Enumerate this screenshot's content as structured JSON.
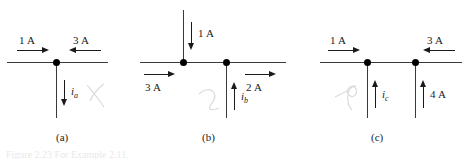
{
  "figure": {
    "caption": "Figure 2.23 For Example 2.11.",
    "background_color": "#ffffff",
    "wire_color": "#3a3a3a",
    "arrow_color": "#1a1a1a",
    "node_color": "#000000",
    "pencil_color": "#d9d9d9"
  },
  "panels": [
    {
      "id": "a",
      "caption": "(a)",
      "nodes": 1,
      "currents": [
        {
          "name": "left-branch-current",
          "label": "1 A",
          "direction": "right",
          "known": true
        },
        {
          "name": "right-branch-current",
          "label": "3 A",
          "direction": "left",
          "known": true
        },
        {
          "name": "unknown-branch-current",
          "label": "i",
          "subscript": "a",
          "direction": "down",
          "known": false
        }
      ]
    },
    {
      "id": "b",
      "caption": "(b)",
      "nodes": 2,
      "currents": [
        {
          "name": "top-branch-current",
          "label": "1 A",
          "direction": "down",
          "known": true
        },
        {
          "name": "left-branch-current",
          "label": "3 A",
          "direction": "right",
          "known": true
        },
        {
          "name": "right-branch-current",
          "label": "2 A",
          "direction": "right",
          "known": true
        },
        {
          "name": "unknown-branch-current",
          "label": "i",
          "subscript": "b",
          "direction": "up",
          "known": false
        }
      ]
    },
    {
      "id": "c",
      "caption": "(c)",
      "nodes": 2,
      "currents": [
        {
          "name": "left-branch-current",
          "label": "1 A",
          "direction": "right",
          "known": true
        },
        {
          "name": "right-branch-current",
          "label": "3 A",
          "direction": "left",
          "known": true
        },
        {
          "name": "unknown-branch-current",
          "label": "i",
          "subscript": "c",
          "direction": "up",
          "known": false
        },
        {
          "name": "bottom-right-branch-current",
          "label": "4 A",
          "direction": "up",
          "known": true
        }
      ]
    }
  ]
}
